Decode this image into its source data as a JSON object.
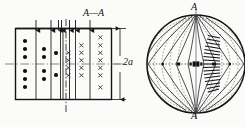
{
  "figure": {
    "colors": {
      "line": "#141414",
      "dashed": "#555555",
      "background": "#fbfbfa",
      "marker": "#101010"
    },
    "labels": {
      "section_aa": "A—A",
      "dimension_2a": "2a",
      "section_mark_top": "A",
      "section_mark_bottom": "A"
    },
    "left_panel": {
      "name": "longitudinal-section",
      "rect": {
        "x": 15,
        "y": 28,
        "width": 97,
        "height": 72
      },
      "midline_y": 64,
      "dot_columns": [
        {
          "x": 25,
          "dots_y": [
            41,
            49,
            57,
            71,
            79,
            87
          ]
        },
        {
          "x": 45,
          "dots_y": [
            49,
            57,
            71,
            79
          ]
        },
        {
          "x": 56,
          "dots_y": [
            53,
            75
          ]
        }
      ],
      "cross_columns": [
        {
          "x": 69,
          "crosses_y": [
            53,
            61,
            68,
            76
          ]
        },
        {
          "x": 82,
          "crosses_y": [
            45,
            53,
            61,
            68,
            76
          ]
        },
        {
          "x": 101,
          "crosses_y": [
            37,
            45,
            53,
            61,
            68,
            76,
            88
          ]
        }
      ],
      "vertical_dividers_x": [
        36,
        51,
        61,
        65,
        75,
        90
      ],
      "section_line_x": 66,
      "top_arrows_x": [
        36,
        51,
        59,
        62,
        65,
        68,
        75,
        90
      ],
      "dimension": {
        "x": 120,
        "top_y": 28,
        "bottom_y": 100
      }
    },
    "right_panel": {
      "name": "circular-cross-section",
      "circle": {
        "cx": 196,
        "cy": 64,
        "r": 50
      },
      "center_axis_x": 196,
      "equator_y": 64,
      "flux_lines_count": 9,
      "equipotential_arcs_count": 11,
      "hatched_sector": {
        "side": "right",
        "bars": 15
      },
      "core_markers_x": [
        180,
        193,
        196,
        199,
        212
      ]
    }
  }
}
